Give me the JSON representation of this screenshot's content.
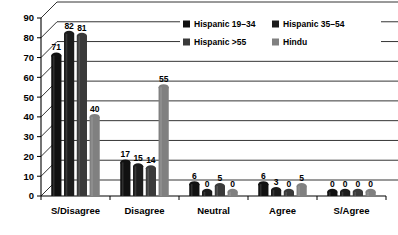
{
  "chart_data": {
    "type": "bar",
    "title": "",
    "subtitle": "",
    "xlabel": "",
    "ylabel": "",
    "ylim": [
      0,
      90
    ],
    "ytick_step": 10,
    "yticks": [
      "0",
      "10",
      "20",
      "30",
      "40",
      "50",
      "60",
      "70",
      "80",
      "90"
    ],
    "grid": true,
    "style": "3d-cylinder",
    "legend_position": "top-right-overlay",
    "categories": [
      "S/Disagree",
      "Disagree",
      "Neutral",
      "Agree",
      "S/Agree"
    ],
    "series": [
      {
        "name": "Hispanic 19–34",
        "color": "#111111",
        "values": [
          71,
          17,
          6,
          6,
          0
        ],
        "labels": [
          "71",
          "17",
          "6",
          "6",
          "0"
        ]
      },
      {
        "name": "Hispanic 35–54",
        "color": "#1c1c1c",
        "values": [
          82,
          15,
          0,
          3,
          0
        ],
        "labels": [
          "82",
          "15",
          "0",
          "3",
          "0"
        ]
      },
      {
        "name": "Hispanic >55",
        "color": "#3a3a3a",
        "values": [
          81,
          14,
          5,
          0,
          0
        ],
        "labels": [
          "81",
          "14",
          "5",
          "0",
          "0"
        ]
      },
      {
        "name": "Hindu",
        "color": "#808080",
        "values": [
          40,
          55,
          0,
          5,
          0
        ],
        "labels": [
          "40",
          "55",
          "0",
          "5",
          "0"
        ]
      }
    ]
  },
  "legend": {
    "entries": [
      {
        "label": "Hispanic 19–34",
        "color": "#111111"
      },
      {
        "label": "Hispanic 35–54",
        "color": "#1c1c1c"
      },
      {
        "label": "Hispanic >55",
        "color": "#3a3a3a"
      },
      {
        "label": "Hindu",
        "color": "#808080"
      }
    ]
  },
  "colors": {
    "background": "#ffffff",
    "axis": "#000000",
    "grid": "#000000"
  }
}
